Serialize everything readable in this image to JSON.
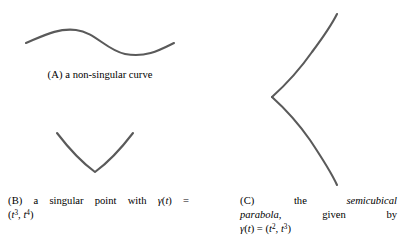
{
  "figure": {
    "background_color": "#ffffff",
    "stroke_color": "#5a5a5a",
    "text_color": "#000000"
  },
  "subfigures": [
    {
      "id": "a",
      "label": "(A)",
      "caption_plain": "(A) a non-singular curve",
      "caption_words": {
        "w1": "a",
        "w2": "non-singular",
        "w3": "curve"
      },
      "curve": {
        "name": "non-singular-curve",
        "kind": "smooth-wave",
        "path": "M 26 43 C 45 35, 58 28, 76 30 C 95 32, 106 50, 125 54 C 146 58, 160 50, 174 43"
      }
    },
    {
      "id": "b",
      "label": "(B)",
      "caption_plain": "(B) a singular point with γ(t) = (t³, t⁴)",
      "caption_line1": {
        "w1": "a",
        "w2": "singular",
        "w3": "point",
        "w4": "with",
        "w5_gamma": "γ",
        "w5_open": "(",
        "w5_t": "t",
        "w5_close": ")",
        "w6_eq": "="
      },
      "caption_line2": {
        "open": "(",
        "t1_base": "t",
        "t1_exp": "3",
        "comma": ", ",
        "t2_base": "t",
        "t2_exp": "4",
        "close": ")"
      },
      "curve": {
        "name": "singular-point-curve",
        "kind": "cusp-v",
        "path": "M 57 133 C 70 150, 84 164, 95 172 C 106 164, 120 150, 133 133"
      }
    },
    {
      "id": "c",
      "label": "(C)",
      "caption_plain": "(C) the semicubical parabola, given by γ(t) = (t², t³)",
      "caption_line1": {
        "w1": "the",
        "w2_italic": "semicubical"
      },
      "caption_line2": {
        "w1_italic": "parabola,",
        "w2": "given",
        "w3": "by"
      },
      "caption_line3": {
        "gamma": "γ",
        "open_t": "(",
        "t": "t",
        "close_t": ")",
        "eq": "=",
        "open": "(",
        "t1_base": "t",
        "t1_exp": "2",
        "comma": ", ",
        "t2_base": "t",
        "t2_exp": "3",
        "close": ")"
      },
      "curve": {
        "name": "semicubical-parabola",
        "kind": "cusp-semicubical",
        "path_upper": "M 72 97 C 82 88, 98 72, 112 52 C 124 36, 132 24, 137 14",
        "path_lower": "M 72 97 C 82 106, 96 120, 110 140 C 122 158, 132 174, 137 185"
      }
    }
  ]
}
